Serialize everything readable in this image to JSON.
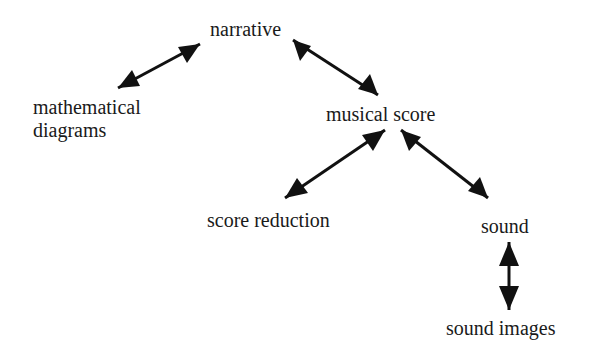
{
  "diagram": {
    "type": "concept-graph",
    "nodes": [
      {
        "id": "narrative",
        "label": "narrative"
      },
      {
        "id": "mathematical_diagrams",
        "label_line1": "mathematical",
        "label_line2": "diagrams"
      },
      {
        "id": "musical_score",
        "label": "musical score"
      },
      {
        "id": "score_reduction",
        "label": "score reduction"
      },
      {
        "id": "sound",
        "label": "sound"
      },
      {
        "id": "sound_images",
        "label": "sound images"
      }
    ],
    "edges": [
      {
        "from": "narrative",
        "to": "mathematical_diagrams",
        "direction": "bidirectional"
      },
      {
        "from": "narrative",
        "to": "musical_score",
        "direction": "bidirectional"
      },
      {
        "from": "musical_score",
        "to": "score_reduction",
        "direction": "bidirectional"
      },
      {
        "from": "musical_score",
        "to": "sound",
        "direction": "bidirectional"
      },
      {
        "from": "sound",
        "to": "sound_images",
        "direction": "bidirectional"
      }
    ],
    "colors": {
      "ink": "#1a1a1a",
      "background": "#ffffff"
    }
  }
}
